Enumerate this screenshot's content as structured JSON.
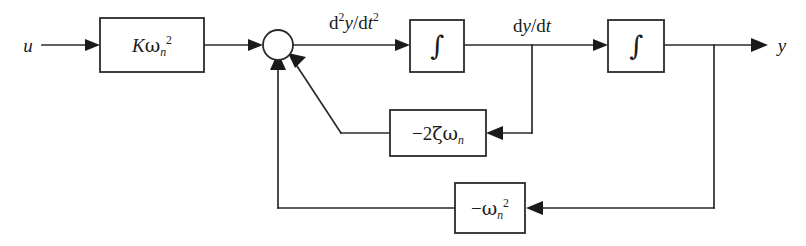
{
  "diagram": {
    "type": "control-system-block-diagram",
    "background_color": "#ffffff",
    "line_color": "#2b2b2b",
    "text_color": "#1a1a1a",
    "canvas": {
      "width": 806,
      "height": 246
    }
  },
  "signals": {
    "input": "u",
    "output": "y",
    "second_derivative": {
      "num_d": "d",
      "num_sup": "2",
      "num_var": "y",
      "den_d": "d",
      "den_var": "t",
      "den_sup": "2"
    },
    "first_derivative": {
      "num_d": "d",
      "num_var": "y",
      "den_d": "d",
      "den_var": "t"
    }
  },
  "blocks": [
    {
      "id": "gain-k-omega-n-squared",
      "name": "forward-gain-block",
      "label_plain": "Kw_n^2",
      "parts": {
        "gain": "K",
        "omega": "ω",
        "sub": "n",
        "sup": "2"
      },
      "x": 100,
      "y": 18,
      "w": 104,
      "h": 54
    },
    {
      "id": "integrator-1",
      "name": "integrator-block-1",
      "label_plain": "∫",
      "glyph": "∫",
      "x": 410,
      "y": 20,
      "w": 54,
      "h": 52
    },
    {
      "id": "integrator-2",
      "name": "integrator-block-2",
      "label_plain": "∫",
      "glyph": "∫",
      "x": 608,
      "y": 20,
      "w": 56,
      "h": 52
    },
    {
      "id": "damping-feedback",
      "name": "damping-feedback-block",
      "label_plain": "-2ζω_n",
      "parts": {
        "sign": "−",
        "coef": "2",
        "zeta": "ζ",
        "omega": "ω",
        "sub": "n"
      },
      "x": 390,
      "y": 110,
      "w": 96,
      "h": 46
    },
    {
      "id": "stiffness-feedback",
      "name": "stiffness-feedback-block",
      "label_plain": "-ω_n^2",
      "parts": {
        "sign": "−",
        "omega": "ω",
        "sub": "n",
        "sup": "2"
      },
      "x": 455,
      "y": 183,
      "w": 70,
      "h": 50
    }
  ],
  "summing_junction": {
    "name": "summing-junction",
    "cx": 278,
    "cy": 45,
    "r": 15,
    "input_count": 3,
    "inputs": [
      "forward-path",
      "stiffness-feedback",
      "damping-feedback"
    ]
  },
  "tap_points": [
    {
      "name": "dy-dt-tap",
      "x": 532,
      "y": 45
    },
    {
      "name": "output-tap",
      "x": 714,
      "y": 45
    }
  ],
  "connections": [
    {
      "name": "input-to-gain",
      "from": "u",
      "to": "forward-gain-block"
    },
    {
      "name": "gain-to-sum",
      "from": "forward-gain-block",
      "to": "summing-junction"
    },
    {
      "name": "sum-to-integrator-1",
      "from": "summing-junction",
      "to": "integrator-block-1",
      "signal": "d2y/dt2"
    },
    {
      "name": "integrator-1-to-integrator-2",
      "from": "integrator-block-1",
      "to": "integrator-block-2",
      "signal": "dy/dt"
    },
    {
      "name": "integrator-2-to-output",
      "from": "integrator-block-2",
      "to": "y"
    },
    {
      "name": "dy-dt-to-damping-feedback",
      "from": "dy-dt-tap",
      "to": "damping-feedback-block"
    },
    {
      "name": "damping-feedback-to-sum",
      "from": "damping-feedback-block",
      "to": "summing-junction"
    },
    {
      "name": "output-to-stiffness-feedback",
      "from": "output-tap",
      "to": "stiffness-feedback-block"
    },
    {
      "name": "stiffness-feedback-to-sum",
      "from": "stiffness-feedback-block",
      "to": "summing-junction"
    }
  ]
}
